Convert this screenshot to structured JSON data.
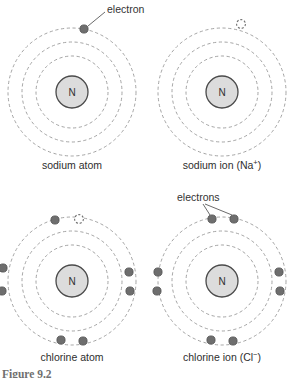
{
  "figure": {
    "caption": "Figure 9.2",
    "background_color": "#ffffff",
    "shell_color": "#9a9a9a",
    "electron_color": "#6e6e6e",
    "nucleus_fill": "#dcdcdc",
    "nucleus_stroke": "#4a4a4a"
  },
  "annotations": {
    "electron_singular": "electron",
    "electrons_plural": "electrons"
  },
  "panels": [
    {
      "id": "sodium-atom",
      "caption": "sodium atom",
      "nucleus_label": "N",
      "shell_count": 3,
      "filled_electrons": 1,
      "empty_slots": 0
    },
    {
      "id": "sodium-ion",
      "caption": "sodium ion (Na",
      "caption_charge": "+",
      "caption_tail": ")",
      "nucleus_label": "N",
      "shell_count": 3,
      "filled_electrons": 0,
      "empty_slots": 1
    },
    {
      "id": "chlorine-atom",
      "caption": "chlorine atom",
      "nucleus_label": "N",
      "shell_count": 3,
      "filled_electrons": 7,
      "empty_slots": 1
    },
    {
      "id": "chlorine-ion",
      "caption": "chlorine ion (Cl",
      "caption_charge": "−",
      "caption_tail": ")",
      "nucleus_label": "N",
      "shell_count": 3,
      "filled_electrons": 8,
      "empty_slots": 0
    }
  ]
}
